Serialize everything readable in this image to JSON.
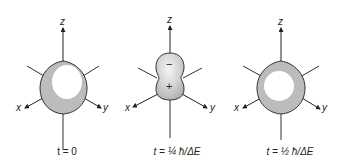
{
  "panels": [
    {
      "id": "t0",
      "shape": "sphere",
      "caption": "t = 0",
      "axes": {
        "x": "x",
        "y": "y",
        "z": "z"
      },
      "signs": []
    },
    {
      "id": "t_quarter",
      "shape": "dumbbell",
      "caption": "t = ¼ ħ/ΔE",
      "axes": {
        "x": "x",
        "y": "y",
        "z": "z"
      },
      "signs": [
        "−",
        "+"
      ]
    },
    {
      "id": "t_half",
      "shape": "sphere",
      "caption": "t = ½ ħ/ΔE",
      "axes": {
        "x": "x",
        "y": "y",
        "z": "z"
      },
      "signs": []
    }
  ],
  "colors": {
    "fill": "#bdbdbd",
    "highlight": "#ffffff",
    "line": "#333333"
  }
}
